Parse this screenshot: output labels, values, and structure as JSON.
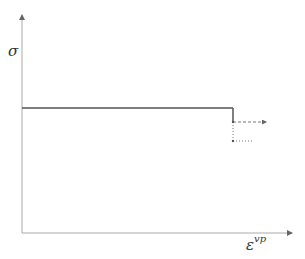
{
  "diagram": {
    "type": "stress-strain schematic (viscoplastic)",
    "y_axis_label": "σ",
    "x_axis_label": "ε",
    "x_axis_label_superscript": "vp",
    "colors": {
      "axis": "#aaaaaa",
      "curve": "#555555",
      "dashed": "#777777"
    },
    "elements": [
      {
        "name": "stress-plateau",
        "style": "solid",
        "description": "constant stress line"
      },
      {
        "name": "stress-drop",
        "style": "solid",
        "description": "vertical drop at end of plateau"
      },
      {
        "name": "continuation-upper",
        "style": "dashed",
        "description": "dashed arrow continuing after drop"
      },
      {
        "name": "continuation-lower",
        "style": "dotted",
        "description": "dotted branch at lower stress"
      }
    ]
  }
}
